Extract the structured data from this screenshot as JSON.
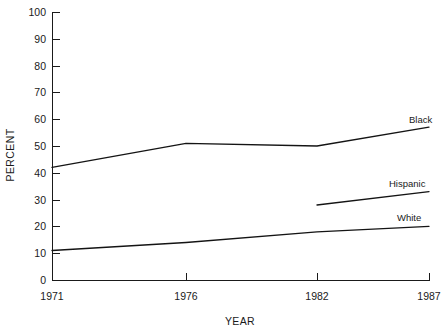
{
  "chart_data": {
    "type": "line",
    "title": "",
    "xlabel": "YEAR",
    "ylabel": "PERCENT",
    "x": [
      1971,
      1976,
      1982,
      1987
    ],
    "categories": [
      "1971",
      "1976",
      "1982",
      "1987"
    ],
    "xtick_labels": [
      "1971",
      "1976",
      "1982",
      "1987"
    ],
    "ytick_labels": [
      "0",
      "10",
      "20",
      "30",
      "40",
      "50",
      "60",
      "70",
      "80",
      "90",
      "100"
    ],
    "ylim": [
      0,
      100
    ],
    "xlim": [
      1971,
      1987
    ],
    "grid": false,
    "legend": "inline-right-end-labels",
    "series": [
      {
        "name": "Black",
        "label": "Black",
        "x": [
          1971,
          1976,
          1982,
          1987
        ],
        "values": [
          42,
          51,
          50,
          57
        ],
        "color": "#141414"
      },
      {
        "name": "Hispanic",
        "label": "Hispanic",
        "x": [
          1982,
          1987
        ],
        "values": [
          28,
          33
        ],
        "color": "#141414"
      },
      {
        "name": "White",
        "label": "White",
        "x": [
          1971,
          1976,
          1982,
          1987
        ],
        "values": [
          11,
          14,
          18,
          20
        ],
        "color": "#141414"
      }
    ]
  },
  "axes": {
    "y_title": "PERCENT",
    "x_title": "YEAR",
    "y_ticks": [
      {
        "label": "100",
        "value": 100
      },
      {
        "label": "90",
        "value": 90
      },
      {
        "label": "80",
        "value": 80
      },
      {
        "label": "70",
        "value": 70
      },
      {
        "label": "60",
        "value": 60
      },
      {
        "label": "50",
        "value": 50
      },
      {
        "label": "40",
        "value": 40
      },
      {
        "label": "30",
        "value": 30
      },
      {
        "label": "20",
        "value": 20
      },
      {
        "label": "10",
        "value": 10
      },
      {
        "label": "0",
        "value": 0
      }
    ],
    "x_ticks": [
      {
        "label": "1971",
        "value": 1971
      },
      {
        "label": "1976",
        "value": 1976
      },
      {
        "label": "1982",
        "value": 1982
      },
      {
        "label": "1987",
        "value": 1987
      }
    ]
  },
  "series_labels": {
    "black": "Black",
    "hispanic": "Hispanic",
    "white": "White"
  },
  "colors": {
    "line": "#141414",
    "axis": "#1a1a1a",
    "background": "#ffffff"
  }
}
